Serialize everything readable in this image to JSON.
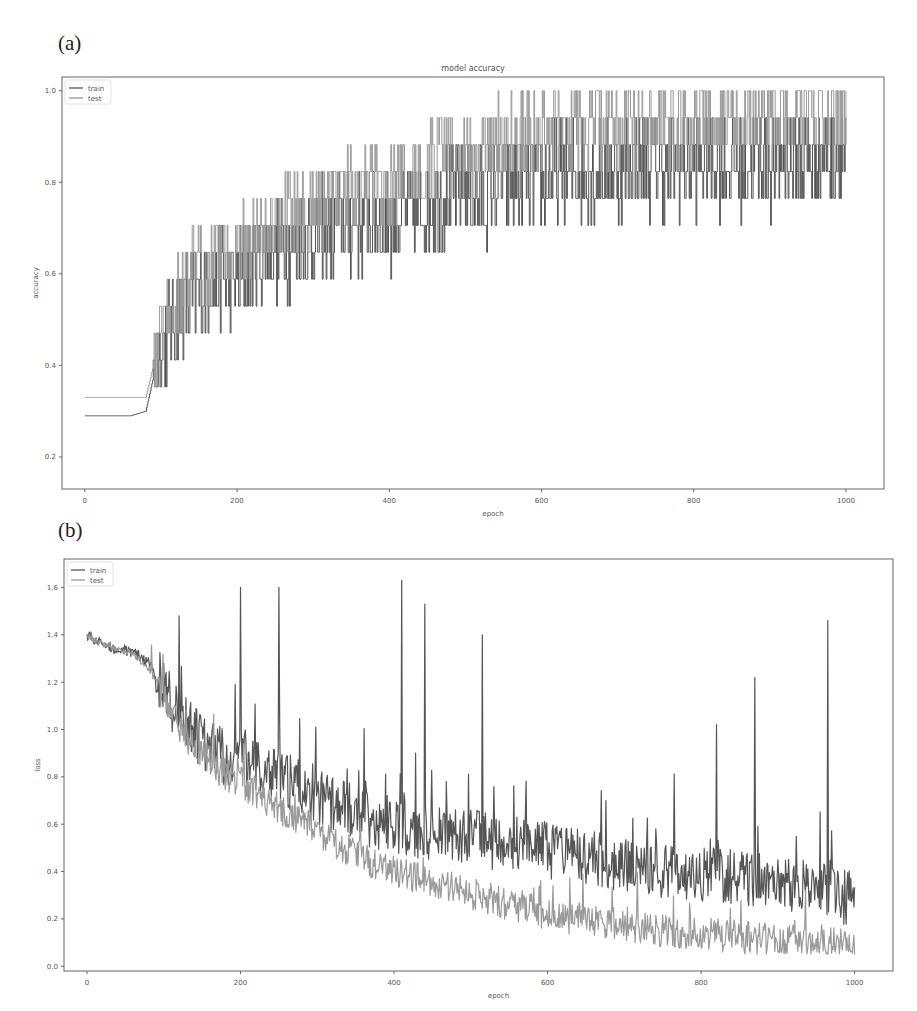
{
  "figure": {
    "panel_a_label": "(a)",
    "panel_b_label": "(b)"
  },
  "chart_data": [
    {
      "type": "line",
      "title": "model accuracy",
      "xlabel": "epoch",
      "ylabel": "accuracy",
      "xlim": [
        -30,
        1050
      ],
      "ylim": [
        0.13,
        1.03
      ],
      "xticks": [
        0,
        200,
        400,
        600,
        800,
        1000
      ],
      "yticks": [
        0.2,
        0.4,
        0.6,
        0.8,
        1.0
      ],
      "ytick_labels": [
        "0.2",
        "0.4",
        "0.6",
        "0.8",
        "1.0"
      ],
      "grid": false,
      "legend_position": "upper left",
      "x": [
        0,
        20,
        40,
        60,
        80,
        100,
        120,
        140,
        160,
        180,
        200,
        220,
        240,
        260,
        280,
        300,
        320,
        340,
        360,
        380,
        400,
        420,
        440,
        460,
        480,
        500,
        520,
        540,
        560,
        580,
        600,
        620,
        640,
        660,
        680,
        700,
        720,
        740,
        760,
        780,
        800,
        820,
        840,
        860,
        880,
        900,
        920,
        940,
        960,
        980,
        1000
      ],
      "series": [
        {
          "name": "train",
          "color": "#555555",
          "noise": 0.11,
          "values": [
            0.29,
            0.29,
            0.29,
            0.29,
            0.3,
            0.45,
            0.5,
            0.55,
            0.58,
            0.6,
            0.58,
            0.62,
            0.65,
            0.66,
            0.66,
            0.68,
            0.7,
            0.7,
            0.71,
            0.72,
            0.72,
            0.73,
            0.74,
            0.76,
            0.77,
            0.78,
            0.77,
            0.79,
            0.8,
            0.8,
            0.81,
            0.82,
            0.82,
            0.83,
            0.82,
            0.83,
            0.84,
            0.84,
            0.83,
            0.84,
            0.84,
            0.85,
            0.84,
            0.84,
            0.85,
            0.84,
            0.85,
            0.85,
            0.86,
            0.86,
            0.87
          ]
        },
        {
          "name": "test",
          "color": "#9a9a9a",
          "noise": 0.09,
          "values": [
            0.33,
            0.33,
            0.33,
            0.33,
            0.33,
            0.47,
            0.53,
            0.6,
            0.63,
            0.66,
            0.64,
            0.68,
            0.71,
            0.72,
            0.73,
            0.75,
            0.77,
            0.78,
            0.79,
            0.8,
            0.8,
            0.81,
            0.83,
            0.85,
            0.86,
            0.87,
            0.86,
            0.89,
            0.91,
            0.91,
            0.92,
            0.92,
            0.92,
            0.93,
            0.92,
            0.93,
            0.93,
            0.94,
            0.93,
            0.93,
            0.94,
            0.94,
            0.94,
            0.93,
            0.94,
            0.94,
            0.94,
            0.95,
            0.95,
            0.95,
            0.95
          ]
        }
      ]
    },
    {
      "type": "line",
      "title": "",
      "xlabel": "epoch",
      "ylabel": "loss",
      "xlim": [
        -30,
        1050
      ],
      "ylim": [
        -0.02,
        1.72
      ],
      "xticks": [
        0,
        200,
        400,
        600,
        800,
        1000
      ],
      "yticks": [
        0.0,
        0.2,
        0.4,
        0.6,
        0.8,
        1.0,
        1.2,
        1.4,
        1.6
      ],
      "ytick_labels": [
        "0.0",
        "0.2",
        "0.4",
        "0.6",
        "0.8",
        "1.0",
        "1.2",
        "1.4",
        "1.6"
      ],
      "grid": false,
      "legend_position": "upper left",
      "x": [
        0,
        20,
        40,
        60,
        80,
        100,
        120,
        140,
        160,
        180,
        200,
        220,
        240,
        260,
        280,
        300,
        320,
        340,
        360,
        380,
        400,
        420,
        440,
        460,
        480,
        500,
        520,
        540,
        560,
        580,
        600,
        620,
        640,
        660,
        680,
        700,
        720,
        740,
        760,
        780,
        800,
        820,
        840,
        860,
        880,
        900,
        920,
        940,
        960,
        980,
        1000
      ],
      "series": [
        {
          "name": "train",
          "color": "#555555",
          "noise": 0.12,
          "spikes": [
            [
              120,
              1.48
            ],
            [
              200,
              1.6
            ],
            [
              250,
              1.6
            ],
            [
              410,
              1.63
            ],
            [
              440,
              1.53
            ],
            [
              515,
              1.4
            ],
            [
              820,
              1.02
            ],
            [
              870,
              1.22
            ],
            [
              965,
              1.46
            ]
          ],
          "values": [
            1.4,
            1.36,
            1.34,
            1.33,
            1.28,
            1.18,
            1.05,
            0.98,
            0.92,
            0.88,
            0.9,
            0.83,
            0.8,
            0.78,
            0.75,
            0.72,
            0.68,
            0.66,
            0.63,
            0.61,
            0.6,
            0.58,
            0.57,
            0.56,
            0.55,
            0.55,
            0.53,
            0.52,
            0.51,
            0.5,
            0.49,
            0.47,
            0.46,
            0.45,
            0.44,
            0.43,
            0.42,
            0.41,
            0.41,
            0.4,
            0.39,
            0.39,
            0.38,
            0.37,
            0.36,
            0.35,
            0.34,
            0.33,
            0.32,
            0.3,
            0.28
          ]
        },
        {
          "name": "test",
          "color": "#9a9a9a",
          "noise": 0.07,
          "values": [
            1.4,
            1.36,
            1.34,
            1.32,
            1.26,
            1.14,
            1.0,
            0.92,
            0.86,
            0.81,
            0.78,
            0.73,
            0.69,
            0.65,
            0.61,
            0.57,
            0.53,
            0.49,
            0.45,
            0.42,
            0.4,
            0.38,
            0.36,
            0.35,
            0.33,
            0.31,
            0.29,
            0.27,
            0.25,
            0.24,
            0.22,
            0.21,
            0.2,
            0.19,
            0.18,
            0.17,
            0.16,
            0.15,
            0.15,
            0.14,
            0.14,
            0.13,
            0.13,
            0.12,
            0.12,
            0.11,
            0.11,
            0.1,
            0.1,
            0.09,
            0.09
          ]
        }
      ]
    }
  ]
}
